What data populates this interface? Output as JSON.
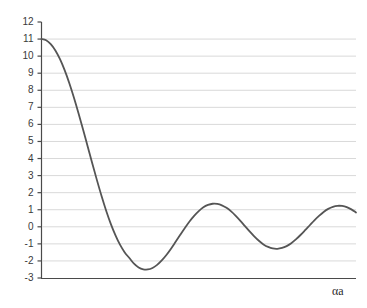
{
  "chart_data": {
    "type": "line",
    "title": "",
    "subtitle": "",
    "xlabel": "αa",
    "ylabel": "",
    "legend": [],
    "legend_position": "none",
    "grid": true,
    "grid_axis": "y",
    "xlim": [
      0,
      13.6
    ],
    "ylim": [
      -3,
      12
    ],
    "x_ticks": [],
    "x_tick_labels": [],
    "y_ticks": [
      -3,
      -2,
      -1,
      0,
      1,
      2,
      3,
      4,
      5,
      6,
      7,
      8,
      9,
      10,
      11,
      12
    ],
    "y_tick_labels": [
      "-3",
      "-2",
      "-1",
      "0",
      "1",
      "2",
      "3",
      "4",
      "5",
      "6",
      "7",
      "8",
      "9",
      "10",
      "11",
      "12"
    ],
    "series": [
      {
        "name": "damped-oscillation",
        "color": "#555555",
        "line_width": 1.8,
        "x": [
          0.0,
          0.2,
          0.4,
          0.6,
          0.8,
          1.0,
          1.2,
          1.4,
          1.6,
          1.8,
          2.0,
          2.2,
          2.4,
          2.6,
          2.8,
          3.0,
          3.2,
          3.4,
          3.6,
          3.8,
          4.0,
          4.2,
          4.4,
          4.6,
          4.8,
          5.0,
          5.2,
          5.4,
          5.6,
          5.8,
          6.0,
          6.2,
          6.4,
          6.6,
          6.8,
          7.0,
          7.2,
          7.4,
          7.6,
          7.8,
          8.0,
          8.2,
          8.4,
          8.6,
          8.8,
          9.0,
          9.2,
          9.4,
          9.6,
          9.8,
          10.0,
          10.2,
          10.4,
          10.6,
          10.8,
          11.0,
          11.2,
          11.4,
          11.6,
          11.8,
          12.0,
          12.2,
          12.4,
          12.6,
          12.8,
          13.0,
          13.2,
          13.4,
          13.6
        ],
        "y": [
          11.0,
          10.93,
          10.7,
          10.33,
          9.82,
          9.18,
          8.43,
          7.58,
          6.66,
          5.69,
          4.69,
          3.69,
          2.72,
          1.79,
          0.93,
          0.16,
          -0.5,
          -1.06,
          -1.5,
          -1.83,
          -2.16,
          -2.38,
          -2.49,
          -2.5,
          -2.41,
          -2.23,
          -1.97,
          -1.65,
          -1.28,
          -0.88,
          -0.47,
          -0.07,
          0.31,
          0.64,
          0.92,
          1.14,
          1.28,
          1.35,
          1.34,
          1.26,
          1.11,
          0.9,
          0.64,
          0.35,
          0.04,
          -0.27,
          -0.56,
          -0.82,
          -1.03,
          -1.18,
          -1.27,
          -1.29,
          -1.24,
          -1.13,
          -0.96,
          -0.74,
          -0.48,
          -0.2,
          0.09,
          0.38,
          0.64,
          0.87,
          1.05,
          1.17,
          1.23,
          1.22,
          1.15,
          1.02,
          0.84
        ]
      }
    ],
    "annotations": {
      "start_value": 11.0,
      "global_min": -2.5,
      "peaks": [
        1.35,
        1.29,
        1.23
      ],
      "troughs": [
        -2.5,
        -1.29
      ]
    },
    "colors": {
      "curve": "#555555",
      "gridline": "#d9d9d9",
      "axis": "#4a4a4a",
      "tick_text": "#3a3a3a",
      "background": "#ffffff"
    }
  }
}
